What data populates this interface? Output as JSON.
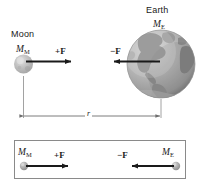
{
  "figure": {
    "title_moon": "Moon",
    "title_earth": "Earth",
    "mass_moon": "M",
    "mass_moon_sub": "M",
    "mass_earth": "M",
    "mass_earth_sub": "E",
    "force_positive": "+F",
    "force_negative": "−F",
    "distance_label": "r",
    "colors": {
      "line": "#1a1a1a",
      "text": "#1a1a1a",
      "dimension_line": "#6d6d6d",
      "box_border": "#8a8a8a",
      "moon_body": "#b9b9b9",
      "moon_highlight": "#dcdcdc",
      "earth_ocean": "#b4b4b4",
      "earth_land": "#8c8c8c",
      "earth_shadow": "#7d7d7d",
      "background": "#ffffff"
    },
    "top_panel": {
      "moon_label": "Moon",
      "moon_mass_label": "M_M",
      "moon_force_label": "+F",
      "earth_label": "Earth",
      "earth_mass_label": "M_E",
      "earth_force_label": "−F",
      "separation_label": "r"
    },
    "bottom_panel": {
      "moon_mass_label": "M_M",
      "moon_force_label": "+F",
      "earth_mass_label": "M_E",
      "earth_force_label": "−F"
    }
  }
}
